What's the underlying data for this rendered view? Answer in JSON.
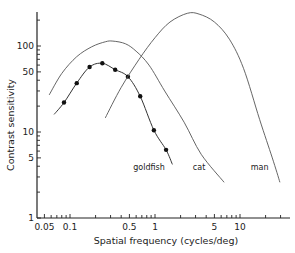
{
  "chart_data": {
    "type": "line",
    "title": "",
    "xlabel": "Spatial frequency (cycles/deg)",
    "ylabel": "Contrast sensitivity",
    "xscale": "log",
    "yscale": "log",
    "xlim": [
      0.04,
      40
    ],
    "ylim": [
      1,
      240
    ],
    "grid": false,
    "x_ticks": [
      {
        "value": 0.05,
        "label": "0.05"
      },
      {
        "value": 0.1,
        "label": "0.1"
      },
      {
        "value": 0.5,
        "label": "0.5"
      },
      {
        "value": 1,
        "label": "1"
      },
      {
        "value": 5,
        "label": "5"
      },
      {
        "value": 10,
        "label": "10"
      }
    ],
    "y_ticks": [
      {
        "value": 1,
        "label": "1"
      },
      {
        "value": 5,
        "label": "5"
      },
      {
        "value": 10,
        "label": "10"
      },
      {
        "value": 50,
        "label": "50"
      },
      {
        "value": 100,
        "label": "100"
      }
    ],
    "series": [
      {
        "name": "goldfish",
        "style": "line+markers",
        "points": [
          [
            0.065,
            16
          ],
          [
            0.085,
            22
          ],
          [
            0.12,
            37
          ],
          [
            0.17,
            57
          ],
          [
            0.24,
            63
          ],
          [
            0.34,
            53
          ],
          [
            0.48,
            44
          ],
          [
            0.67,
            26
          ],
          [
            0.97,
            10.5
          ],
          [
            1.35,
            6.2
          ],
          [
            1.6,
            4.2
          ]
        ],
        "markers": [
          [
            0.085,
            22
          ],
          [
            0.12,
            37
          ],
          [
            0.17,
            57
          ],
          [
            0.24,
            63
          ],
          [
            0.34,
            53
          ],
          [
            0.48,
            44
          ],
          [
            0.67,
            26
          ],
          [
            0.97,
            10.5
          ],
          [
            1.35,
            6.2
          ]
        ],
        "label_pos": [
          0.85,
          3.6
        ]
      },
      {
        "name": "cat",
        "style": "line",
        "points": [
          [
            0.057,
            27
          ],
          [
            0.08,
            48
          ],
          [
            0.12,
            75
          ],
          [
            0.18,
            98
          ],
          [
            0.26,
            112
          ],
          [
            0.32,
            114
          ],
          [
            0.45,
            106
          ],
          [
            0.6,
            87
          ],
          [
            0.85,
            60
          ],
          [
            1.3,
            30
          ],
          [
            2.2,
            13
          ],
          [
            3.5,
            5.5
          ],
          [
            6.5,
            2.6
          ]
        ],
        "label_pos": [
          3.3,
          3.6
        ]
      },
      {
        "name": "man",
        "style": "line",
        "points": [
          [
            0.26,
            14.6
          ],
          [
            0.4,
            33
          ],
          [
            0.65,
            70
          ],
          [
            1.0,
            125
          ],
          [
            1.5,
            190
          ],
          [
            2.4,
            240
          ],
          [
            3.3,
            235
          ],
          [
            5.0,
            190
          ],
          [
            7.5,
            120
          ],
          [
            11,
            55
          ],
          [
            17,
            14
          ],
          [
            24,
            5
          ],
          [
            29.5,
            2.6
          ]
        ],
        "label_pos": [
          17,
          3.6
        ]
      }
    ]
  }
}
